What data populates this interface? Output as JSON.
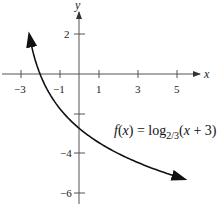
{
  "chart_data": {
    "type": "line",
    "title": "",
    "function_label": {
      "prefix": "f(x) = log",
      "subscript": "2/3",
      "suffix": "(x + 3)"
    },
    "xlabel": "x",
    "ylabel": "y",
    "xlim": [
      -4,
      6
    ],
    "ylim": [
      -7,
      3
    ],
    "x_ticks": [
      -3,
      -1,
      1,
      3,
      5
    ],
    "y_ticks": [
      2,
      -2,
      -4,
      -6
    ],
    "y_tick_labels_shown": [
      2,
      -4,
      -6
    ],
    "grid": false,
    "series": [
      {
        "name": "f(x) = log_{2/3}(x+3)",
        "x": [
          -2.55,
          -2.5,
          -2.25,
          -2.0,
          -1.5,
          -1.0,
          0.0,
          1.0,
          2.0,
          3.0,
          4.0,
          5.0,
          5.4
        ],
        "y": [
          1.97,
          1.71,
          0.71,
          0.0,
          -1.0,
          -1.71,
          -2.71,
          -3.42,
          -3.97,
          -4.42,
          -4.8,
          -5.13,
          -5.25
        ]
      }
    ],
    "arrows": "both ends of curve"
  },
  "labels": {
    "x_axis": "x",
    "y_axis": "y",
    "x_ticks": [
      "−3",
      "−1",
      "1",
      "3",
      "5"
    ],
    "y_ticks": [
      "2",
      "−4",
      "−6"
    ],
    "fn_prefix": "f(x) = log",
    "fn_sub": "2/3",
    "fn_suffix": "(x + 3)"
  }
}
